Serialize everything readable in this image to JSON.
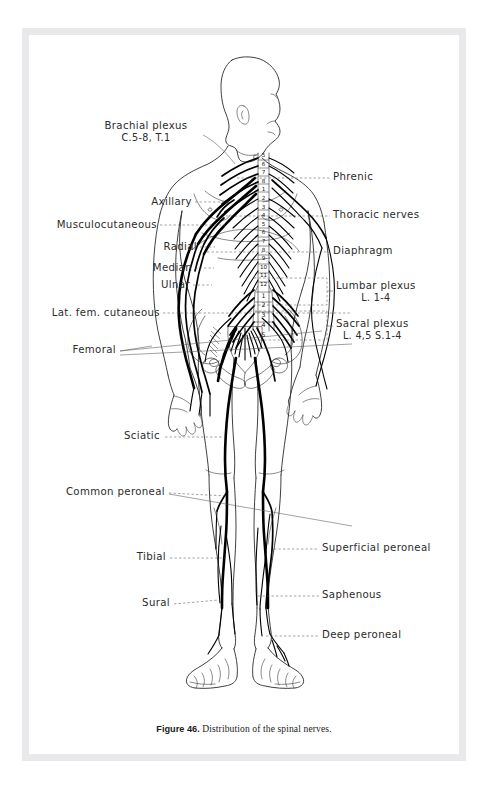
{
  "page": {
    "background": "#ffffff",
    "frame_color": "#e9e9eb",
    "ink_color": "#111111"
  },
  "caption": {
    "figure_number": "Figure 46.",
    "text": "Distribution of the spinal nerves."
  },
  "labels_left": [
    {
      "id": "brachial-plexus",
      "text": "Brachial plexus",
      "sub": "C.5-8, T.1",
      "x": 86,
      "y": 98
    },
    {
      "id": "axillary",
      "text": "Axillary",
      "x": 141,
      "y": 172
    },
    {
      "id": "musculocutaneous",
      "text": "Musculocutaneous",
      "x": 42,
      "y": 195
    },
    {
      "id": "radial",
      "text": "Radial",
      "x": 145,
      "y": 217
    },
    {
      "id": "median",
      "text": "Median",
      "x": 138,
      "y": 238
    },
    {
      "id": "ulnar",
      "text": "Ulnar",
      "x": 148,
      "y": 255
    },
    {
      "id": "lat-fem-cutaneous",
      "text": "Lat. fem. cutaneous",
      "x": 37,
      "y": 283
    },
    {
      "id": "femoral",
      "text": "Femoral",
      "x": 58,
      "y": 320
    },
    {
      "id": "sciatic",
      "text": "Sciatic",
      "x": 108,
      "y": 406
    },
    {
      "id": "common-peroneal",
      "text": "Common peroneal",
      "x": 45,
      "y": 462
    },
    {
      "id": "tibial",
      "text": "Tibial",
      "x": 124,
      "y": 527
    },
    {
      "id": "sural",
      "text": "Sural",
      "x": 128,
      "y": 573
    }
  ],
  "labels_right": [
    {
      "id": "phrenic",
      "text": "Phrenic",
      "x": 310,
      "y": 148
    },
    {
      "id": "thoracic-nerves",
      "text": "Thoracic nerves",
      "x": 310,
      "y": 186
    },
    {
      "id": "diaphragm",
      "text": "Diaphragm",
      "x": 310,
      "y": 222
    },
    {
      "id": "lumbar-plexus",
      "text": "Lumbar plexus",
      "sub": "L. 1-4",
      "x": 313,
      "y": 258
    },
    {
      "id": "sacral-plexus",
      "text": "Sacral plexus",
      "sub": "L. 4,5  S.1-4",
      "x": 313,
      "y": 297
    },
    {
      "id": "superficial-peroneal",
      "text": "Superficial peroneal",
      "x": 300,
      "y": 519
    },
    {
      "id": "saphenous",
      "text": "Saphenous",
      "x": 300,
      "y": 566
    },
    {
      "id": "deep-peroneal",
      "text": "Deep peroneal",
      "x": 300,
      "y": 606
    }
  ],
  "vertebrae": {
    "cervical_marker": "C",
    "cervical": [
      "5",
      "6",
      "7",
      "8"
    ],
    "thoracic": [
      "1",
      "2",
      "3",
      "4",
      "5",
      "6",
      "7",
      "8",
      "9",
      "10",
      "11",
      "12"
    ],
    "lumbar": [
      "1",
      "2",
      "3",
      "4",
      "5"
    ]
  },
  "figure": {
    "view": "anterior body, head in right profile"
  }
}
